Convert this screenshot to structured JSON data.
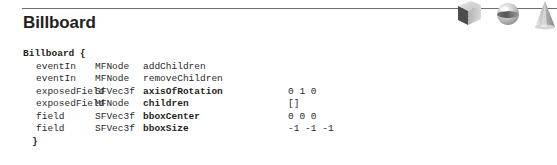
{
  "page": {
    "title": "Billboard",
    "node_open": "Billboard {",
    "node_close": "}"
  },
  "decoration": {
    "shapes": [
      "cube-shape",
      "sphere-shape",
      "cone-shape"
    ],
    "colors": {
      "cube_front": "#4d4d4f",
      "cube_top": "#d9d9d9",
      "cube_side": "#a7a7a9",
      "sphere_light": "#ededed",
      "sphere_band": "#58585a",
      "cone_fill": "#c8c8ca",
      "rule": "#6e6e6e"
    }
  },
  "interface": {
    "columns": [
      "access",
      "type",
      "name",
      "value"
    ],
    "rows": [
      {
        "access": "eventIn",
        "type": "MFNode",
        "name": "addChildren",
        "value": "",
        "bold": false
      },
      {
        "access": "eventIn",
        "type": "MFNode",
        "name": "removeChildren",
        "value": "",
        "bold": false
      },
      {
        "access": "exposedField",
        "type": "SFVec3f",
        "name": "axisOfRotation",
        "value": "0 1 0",
        "bold": true
      },
      {
        "access": "exposedField",
        "type": "MFNode",
        "name": "children",
        "value": "[]",
        "bold": true
      },
      {
        "access": "field",
        "type": "SFVec3f",
        "name": "bboxCenter",
        "value": "0 0 0",
        "bold": true
      },
      {
        "access": "field",
        "type": "SFVec3f",
        "name": "bboxSize",
        "value": "-1 -1 -1",
        "bold": true
      }
    ]
  }
}
